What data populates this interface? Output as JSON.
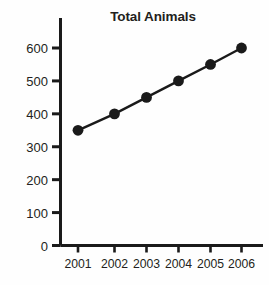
{
  "chart_data": {
    "type": "line",
    "title": "Total Animals",
    "xlabel": "",
    "ylabel": "",
    "categories": [
      "2001",
      "2002",
      "2003",
      "2004",
      "2005",
      "2006"
    ],
    "x": [
      2001,
      2002,
      2003,
      2004,
      2005,
      2006
    ],
    "values": [
      350,
      400,
      450,
      500,
      550,
      600
    ],
    "series": [
      {
        "name": "Total Animals",
        "values": [
          350,
          400,
          450,
          500,
          550,
          600
        ]
      }
    ],
    "ylim": [
      0,
      620
    ],
    "yticks": [
      0,
      100,
      200,
      300,
      400,
      500,
      600
    ],
    "ytick_labels": [
      "0",
      "100",
      "200",
      "300",
      "400",
      "500",
      "600"
    ],
    "xtick_labels": [
      "2001",
      "2002",
      "2003",
      "2004",
      "2005",
      "2006"
    ],
    "grid": false,
    "legend": false,
    "legend_position": "none",
    "marker": "filled-circle",
    "line_color": "#1a1a1a",
    "marker_color": "#1a1a1a",
    "axis_color": "#1a1a1a",
    "background_color": "#fefefe",
    "text_color": "#231f20"
  }
}
